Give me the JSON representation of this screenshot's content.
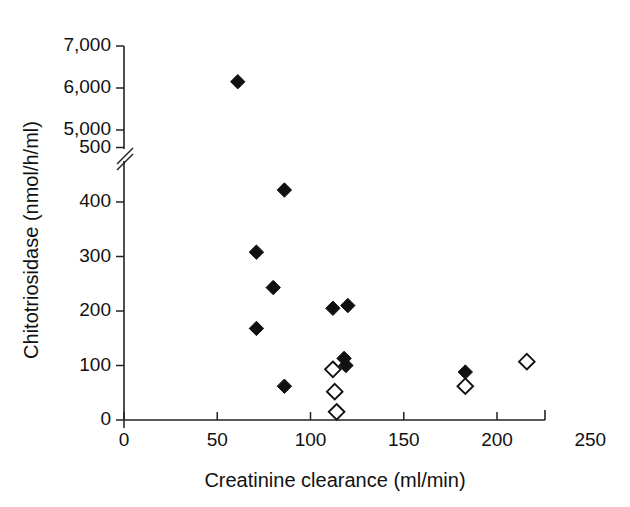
{
  "chart_data": {
    "type": "scatter",
    "title": "",
    "xlabel": "Creatinine clearance (ml/min)",
    "ylabel": "Chitotriosidase (nmol/h/ml)",
    "xlim": [
      0,
      250
    ],
    "xticks": [
      0,
      50,
      100,
      150,
      200,
      250
    ],
    "xticklabels": [
      "0",
      "50",
      "100",
      "150",
      "200",
      "250"
    ],
    "ylim": [
      0,
      7000
    ],
    "yticks": [
      0,
      100,
      200,
      300,
      400,
      500,
      5000,
      6000,
      7000
    ],
    "yticklabels": [
      "0",
      "100",
      "200",
      "300",
      "400",
      "500",
      "5,000",
      "6,000",
      "7,000"
    ],
    "y_axis_break": {
      "present": true,
      "below": 500,
      "above": 5000
    },
    "grid": false,
    "legend": null,
    "series": [
      {
        "name": "filled-diamond",
        "marker": "filled diamond",
        "color": "#111111",
        "points": [
          {
            "x": 61,
            "y": 6150
          },
          {
            "x": 86,
            "y": 422
          },
          {
            "x": 71,
            "y": 308
          },
          {
            "x": 80,
            "y": 243
          },
          {
            "x": 112,
            "y": 205
          },
          {
            "x": 120,
            "y": 210
          },
          {
            "x": 71,
            "y": 168
          },
          {
            "x": 119,
            "y": 100
          },
          {
            "x": 118,
            "y": 113
          },
          {
            "x": 183,
            "y": 88
          },
          {
            "x": 86,
            "y": 62
          }
        ]
      },
      {
        "name": "open-diamond",
        "marker": "open diamond",
        "color": "#ffffff",
        "points": [
          {
            "x": 216,
            "y": 107
          },
          {
            "x": 112,
            "y": 93
          },
          {
            "x": 183,
            "y": 62
          },
          {
            "x": 113,
            "y": 52
          },
          {
            "x": 114,
            "y": 15
          }
        ]
      }
    ]
  }
}
